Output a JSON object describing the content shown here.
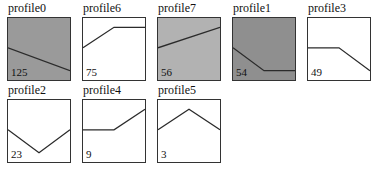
{
  "chart_data": {
    "type": "line",
    "title": "",
    "layout": "small-multiples grid, 5 columns x 2 rows",
    "grid": false,
    "legend": false,
    "ylim": [
      0,
      1
    ],
    "x": [
      0,
      0.5,
      1
    ],
    "series": [
      {
        "name": "profile0",
        "count": 125,
        "fill": "#9a9a9a",
        "points": [
          [
            0,
            0.52
          ],
          [
            1,
            0.15
          ]
        ]
      },
      {
        "name": "profile6",
        "count": 75,
        "fill": "#ffffff",
        "points": [
          [
            0,
            0.52
          ],
          [
            0.5,
            0.85
          ],
          [
            1,
            0.85
          ]
        ]
      },
      {
        "name": "profile7",
        "count": 56,
        "fill": "#b2b2b2",
        "points": [
          [
            0,
            0.52
          ],
          [
            1,
            0.85
          ]
        ]
      },
      {
        "name": "profile1",
        "count": 54,
        "fill": "#8f8f8f",
        "points": [
          [
            0,
            0.52
          ],
          [
            0.5,
            0.15
          ],
          [
            1,
            0.15
          ]
        ]
      },
      {
        "name": "profile3",
        "count": 49,
        "fill": "#ffffff",
        "points": [
          [
            0,
            0.52
          ],
          [
            0.5,
            0.52
          ],
          [
            1,
            0.15
          ]
        ]
      },
      {
        "name": "profile2",
        "count": 23,
        "fill": "#ffffff",
        "points": [
          [
            0,
            0.52
          ],
          [
            0.5,
            0.15
          ],
          [
            1,
            0.52
          ]
        ]
      },
      {
        "name": "profile4",
        "count": 9,
        "fill": "#ffffff",
        "points": [
          [
            0,
            0.52
          ],
          [
            0.5,
            0.52
          ],
          [
            1,
            0.85
          ]
        ]
      },
      {
        "name": "profile5",
        "count": 3,
        "fill": "#ffffff",
        "points": [
          [
            0,
            0.52
          ],
          [
            0.5,
            0.85
          ],
          [
            1,
            0.52
          ]
        ]
      }
    ]
  },
  "tiles": [
    {
      "title": "profile0",
      "count": "125"
    },
    {
      "title": "profile6",
      "count": "75"
    },
    {
      "title": "profile7",
      "count": "56"
    },
    {
      "title": "profile1",
      "count": "54"
    },
    {
      "title": "profile3",
      "count": "49"
    },
    {
      "title": "profile2",
      "count": "23"
    },
    {
      "title": "profile4",
      "count": "9"
    },
    {
      "title": "profile5",
      "count": "3"
    }
  ],
  "colors": {
    "line": "#2b2b2b",
    "border": "#333333"
  }
}
